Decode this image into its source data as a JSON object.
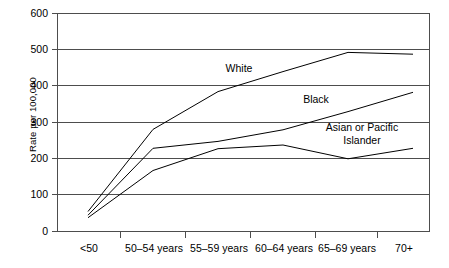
{
  "chart_data": {
    "type": "line",
    "title": "",
    "xlabel": "",
    "ylabel": "Rate per 100,000",
    "ylim": [
      0,
      600
    ],
    "yticks": [
      0,
      100,
      200,
      300,
      400,
      500,
      600
    ],
    "grid": true,
    "legend_position": "inline-labels",
    "categories": [
      "<50",
      "50–54 years",
      "55–59 years",
      "60–64 years",
      "65–69 years",
      "70+"
    ],
    "series": [
      {
        "name": "White",
        "values": [
          55,
          281,
          385,
          440,
          493,
          488
        ]
      },
      {
        "name": "Black",
        "values": [
          45,
          229,
          248,
          280,
          330,
          383
        ]
      },
      {
        "name": "Asian or Pacific Islander",
        "values": [
          38,
          168,
          228,
          238,
          200,
          229
        ]
      }
    ],
    "annotations": [
      {
        "text": "White",
        "series": "White"
      },
      {
        "text": "Black",
        "series": "Black"
      },
      {
        "text": "Asian or Pacific",
        "series": "Asian or Pacific Islander"
      },
      {
        "text": "Islander",
        "series": "Asian or Pacific Islander"
      }
    ]
  },
  "axis": {
    "y_title": "Rate per 100,000",
    "y_labels": [
      "600",
      "500",
      "400",
      "300",
      "200",
      "100",
      "0"
    ],
    "x_labels": [
      "<50",
      "50–54 years",
      "55–59 years",
      "60–64 years",
      "65–69 years",
      "70+"
    ]
  },
  "series_labels": {
    "white": "White",
    "black": "Black",
    "api_line1": "Asian or Pacific",
    "api_line2": "Islander"
  },
  "colors": {
    "line": "#000000",
    "grid": "#4d4d4d",
    "axis": "#4d4d4d",
    "background": "#ffffff"
  }
}
